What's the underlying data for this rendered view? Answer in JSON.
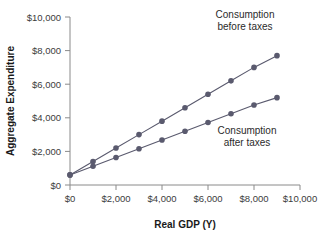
{
  "chart_data": {
    "type": "line",
    "title": "",
    "subtitle": "",
    "xlabel": "Real GDP (Y)",
    "ylabel": "Aggregate Expenditure",
    "xlim": [
      0,
      10000
    ],
    "ylim": [
      0,
      10000
    ],
    "grid": false,
    "legend_position": "inline-annotation",
    "xticks": [
      0,
      2000,
      4000,
      6000,
      8000,
      10000
    ],
    "xticklabels": [
      "$0",
      "$2,000",
      "$4,000",
      "$6,000",
      "$8,000",
      "$10,000"
    ],
    "yticks": [
      0,
      2000,
      4000,
      6000,
      8000,
      10000
    ],
    "yticklabels": [
      "$0",
      "$2,000",
      "$4,000",
      "$6,000",
      "$8,000",
      "$10,000"
    ],
    "x": [
      0,
      1000,
      2000,
      3000,
      4000,
      5000,
      6000,
      7000,
      8000,
      9000
    ],
    "series": [
      {
        "name": "Consumption before taxes",
        "color": "#5a5a6e",
        "marker": "circle",
        "values": [
          600,
          1400,
          2200,
          3000,
          3800,
          4600,
          5400,
          6200,
          7000,
          7700
        ]
      },
      {
        "name": "Consumption after taxes",
        "color": "#5a5a6e",
        "marker": "circle",
        "values": [
          600,
          1120,
          1640,
          2160,
          2680,
          3200,
          3720,
          4240,
          4760,
          5200
        ]
      }
    ],
    "annotations": [
      {
        "text_line1": "Consumption",
        "text_line2": "before taxes",
        "x": 6900,
        "y": 9400
      },
      {
        "text_line1": "Consumption",
        "text_line2": "after taxes",
        "x": 6200,
        "y": 3150
      }
    ]
  },
  "colors": {
    "series": "#5a5a6e",
    "axis": "#8a8a8a",
    "text": "#2b2b2b",
    "background": "#ffffff"
  }
}
